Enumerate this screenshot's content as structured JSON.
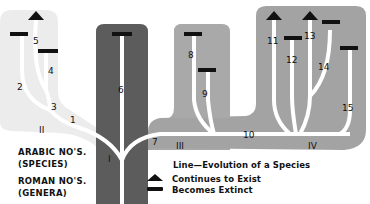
{
  "diagram": {
    "colors": {
      "genus_II": "#ececec",
      "genus_I": "#5c5c5c",
      "genus_III": "#a9a9a9",
      "genus_IV": "#a3a3a3",
      "line": "#ffffff",
      "marker": "#111111"
    },
    "genera_labels": [
      "I",
      "II",
      "III",
      "IV"
    ],
    "species_labels": [
      "1",
      "2",
      "3",
      "4",
      "5",
      "6",
      "7",
      "8",
      "9",
      "10",
      "11",
      "12",
      "13",
      "14",
      "15"
    ],
    "key": {
      "arabic_line1": "ARABIC NO'S.",
      "arabic_line2": "(SPECIES)",
      "roman_line1": "ROMAN NO'S.",
      "roman_line2": "(GENERA)"
    },
    "legend": {
      "line": "Line—Evolution of a Species",
      "continues": "Continues to Exist",
      "extinct": "Becomes Extinct",
      "continues_icon": "triangle-up",
      "extinct_icon": "horizontal-bar"
    }
  }
}
